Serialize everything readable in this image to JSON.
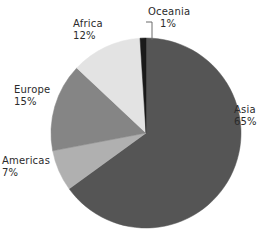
{
  "chart_data": {
    "type": "pie",
    "title": "",
    "categories": [
      "Asia",
      "Americas",
      "Europe",
      "Africa",
      "Oceania"
    ],
    "values": [
      65,
      7,
      15,
      12,
      1
    ],
    "value_suffix": "%",
    "legend": "none",
    "labels_position": "outside",
    "start_angle_deg": 0,
    "direction": "clockwise",
    "grid": false,
    "slices": [
      {
        "name": "Asia",
        "value": 65,
        "value_label": "65%",
        "color": "#555555",
        "start_deg": 0,
        "end_deg": 234.0
      },
      {
        "name": "Americas",
        "value": 7,
        "value_label": "7%",
        "color": "#b0b0b0",
        "start_deg": 234.0,
        "end_deg": 259.2
      },
      {
        "name": "Europe",
        "value": 15,
        "value_label": "15%",
        "color": "#858585",
        "start_deg": 259.2,
        "end_deg": 313.2
      },
      {
        "name": "Africa",
        "value": 12,
        "value_label": "12%",
        "color": "#e3e3e3",
        "start_deg": 313.2,
        "end_deg": 356.4
      },
      {
        "name": "Oceania",
        "value": 1,
        "value_label": "1%",
        "color": "#1a1a1a",
        "start_deg": 356.4,
        "end_deg": 360.0
      }
    ],
    "geometry": {
      "center_x": 146,
      "center_y": 133,
      "radius": 95
    },
    "background_color": "#ffffff",
    "text_color": "#2b2b2b"
  }
}
